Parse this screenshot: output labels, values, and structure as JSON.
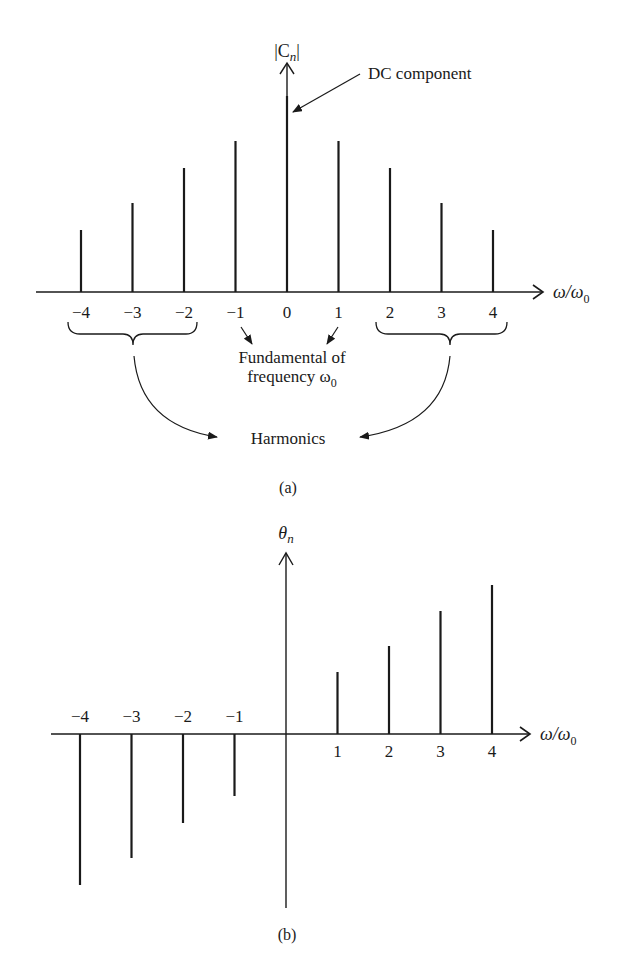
{
  "chart_data": [
    {
      "type": "bar",
      "subtype": "stem",
      "panel": "(a)",
      "title": "",
      "ylabel": "|C_n|",
      "xlabel": "ω/ω0",
      "categories": [
        "-4",
        "-3",
        "-2",
        "-1",
        "0",
        "1",
        "2",
        "3",
        "4"
      ],
      "x": [
        -4,
        -3,
        -2,
        -1,
        0,
        1,
        2,
        3,
        4
      ],
      "values": [
        62,
        89,
        124,
        151,
        196,
        151,
        124,
        89,
        62
      ],
      "value_units": "relative px height (no numeric y-axis scale shown)",
      "grid": false,
      "annotations": [
        {
          "text": "DC component",
          "points_to": 0
        },
        {
          "text": "Fundamental of frequency ω0",
          "points_to": [
            -1,
            1
          ]
        },
        {
          "text": "Harmonics",
          "points_to": [
            [
              -4,
              -3,
              -2
            ],
            [
              2,
              3,
              4
            ]
          ]
        }
      ]
    },
    {
      "type": "bar",
      "subtype": "stem",
      "panel": "(b)",
      "title": "",
      "ylabel": "θ_n",
      "xlabel": "ω/ω0",
      "categories": [
        "-4",
        "-3",
        "-2",
        "-1",
        "1",
        "2",
        "3",
        "4"
      ],
      "x": [
        -4,
        -3,
        -2,
        -1,
        1,
        2,
        3,
        4
      ],
      "values": [
        -151,
        -124,
        -89,
        -62,
        62,
        88,
        123,
        149
      ],
      "value_units": "relative px height (no numeric y-axis scale shown)",
      "grid": false
    }
  ],
  "panel_a": {
    "ylabel_main": "|C",
    "ylabel_sub": "n",
    "ylabel_close": "|",
    "xlabel_main": "ω/ω",
    "xlabel_sub": "0",
    "tick_labels": [
      "−4",
      "−3",
      "−2",
      "−1",
      "0",
      "1",
      "2",
      "3",
      "4"
    ],
    "dc_label": "DC component",
    "fundamental_line1": "Fundamental of",
    "fundamental_line2_main": "frequency ω",
    "fundamental_line2_sub": "0",
    "harmonics_label": "Harmonics",
    "caption": "(a)"
  },
  "panel_b": {
    "ylabel_main": "θ",
    "ylabel_sub": "n",
    "xlabel_main": "ω/ω",
    "xlabel_sub": "0",
    "neg_tick_labels": [
      "−4",
      "−3",
      "−2",
      "−1"
    ],
    "pos_tick_labels": [
      "1",
      "2",
      "3",
      "4"
    ],
    "caption": "(b)"
  },
  "colors": {
    "ink": "#1a1a1a",
    "background": "#ffffff"
  }
}
